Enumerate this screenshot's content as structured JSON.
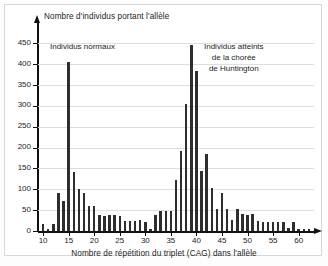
{
  "chart_data": {
    "type": "bar",
    "title": "",
    "ylabel": "Nombre d'individus portant l'allèle",
    "xlabel": "Nombre de répétition du triplet (CAG) dans l'allèle",
    "xlim": [
      9,
      63
    ],
    "ylim": [
      0,
      470
    ],
    "grid": true,
    "legend": "none",
    "yticks": [
      0,
      50,
      100,
      150,
      200,
      250,
      300,
      350,
      400,
      450
    ],
    "xticks": [
      10,
      15,
      20,
      25,
      30,
      35,
      40,
      45,
      50,
      55,
      60
    ],
    "bar_color": "#2e2e2e",
    "grid_color": "#dedede",
    "axis_color": "#111111",
    "annotations": [
      {
        "name": "normal-group",
        "lines": [
          "Individus normaux"
        ]
      },
      {
        "name": "huntington-group",
        "lines": [
          "Individus atteints",
          "de la chorée",
          "de Huntington"
        ]
      }
    ],
    "categories": [
      10,
      11,
      12,
      13,
      14,
      15,
      16,
      17,
      18,
      19,
      20,
      21,
      22,
      23,
      24,
      25,
      26,
      27,
      28,
      29,
      30,
      31,
      32,
      33,
      34,
      35,
      36,
      37,
      38,
      39,
      40,
      41,
      42,
      43,
      44,
      45,
      46,
      47,
      48,
      49,
      50,
      51,
      52,
      53,
      54,
      55,
      56,
      57,
      58,
      59,
      60,
      61,
      62
    ],
    "values": [
      18,
      6,
      18,
      90,
      72,
      405,
      141,
      101,
      90,
      60,
      59,
      38,
      36,
      38,
      38,
      37,
      24,
      23,
      25,
      26,
      22,
      5,
      39,
      48,
      49,
      47,
      122,
      193,
      304,
      446,
      383,
      143,
      185,
      102,
      53,
      92,
      53,
      27,
      53,
      40,
      38,
      41,
      25,
      21,
      22,
      21,
      21,
      21,
      8,
      22,
      5,
      5,
      5
    ]
  }
}
